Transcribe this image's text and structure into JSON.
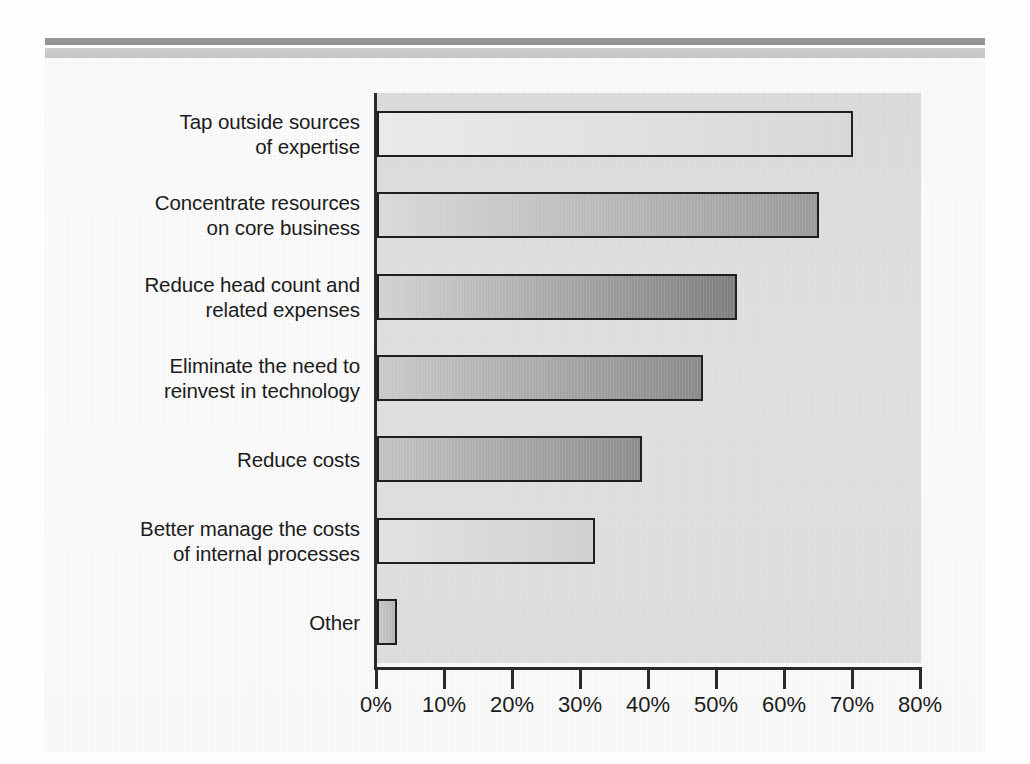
{
  "figure": {
    "background_color": "#fbfbfb",
    "panel_color": "#dedede",
    "rule_dark_color": "#949494",
    "rule_light_color": "#c9c9c9",
    "axis_color": "#2a2a2a",
    "text_color": "#1b1b1b"
  },
  "chart_data": {
    "type": "bar",
    "orientation": "horizontal",
    "title": "",
    "subtitle": "",
    "xlabel": "",
    "ylabel": "",
    "xlim": [
      0,
      80
    ],
    "grid": false,
    "legend": null,
    "categories": [
      "Tap outside sources\nof expertise",
      "Concentrate resources\non core business",
      "Reduce head count and\nrelated expenses",
      "Eliminate the need to\nreinvest in technology",
      "Reduce costs",
      "Better manage the costs\nof internal processes",
      "Other"
    ],
    "values": [
      70,
      65,
      53,
      48,
      39,
      32,
      3
    ],
    "value_unit": "%",
    "tick_values": [
      0,
      10,
      20,
      30,
      40,
      50,
      60,
      70,
      80
    ],
    "tick_labels": [
      "0%",
      "10%",
      "20%",
      "30%",
      "40%",
      "50%",
      "60%",
      "70%",
      "80%"
    ],
    "bars": [
      {
        "label": "Tap outside sources\nof expertise",
        "value": 70,
        "fill_start": "#e9e9e9",
        "fill_end": "#d7d7d7"
      },
      {
        "label": "Concentrate resources\non core business",
        "value": 65,
        "fill_start": "#d9d9d9",
        "fill_end": "#9a9a9a"
      },
      {
        "label": "Reduce head count and\nrelated expenses",
        "value": 53,
        "fill_start": "#d2d2d2",
        "fill_end": "#7e7e7e"
      },
      {
        "label": "Eliminate the need to\nreinvest in technology",
        "value": 48,
        "fill_start": "#c9c9c9",
        "fill_end": "#8a8a8a"
      },
      {
        "label": "Reduce costs",
        "value": 39,
        "fill_start": "#c3c3c3",
        "fill_end": "#8d8d8d"
      },
      {
        "label": "Better manage the costs\nof internal processes",
        "value": 32,
        "fill_start": "#e2e2e2",
        "fill_end": "#cfcfcf"
      },
      {
        "label": "Other",
        "value": 3,
        "fill_start": "#c8c8c8",
        "fill_end": "#b4b4b4"
      }
    ]
  }
}
